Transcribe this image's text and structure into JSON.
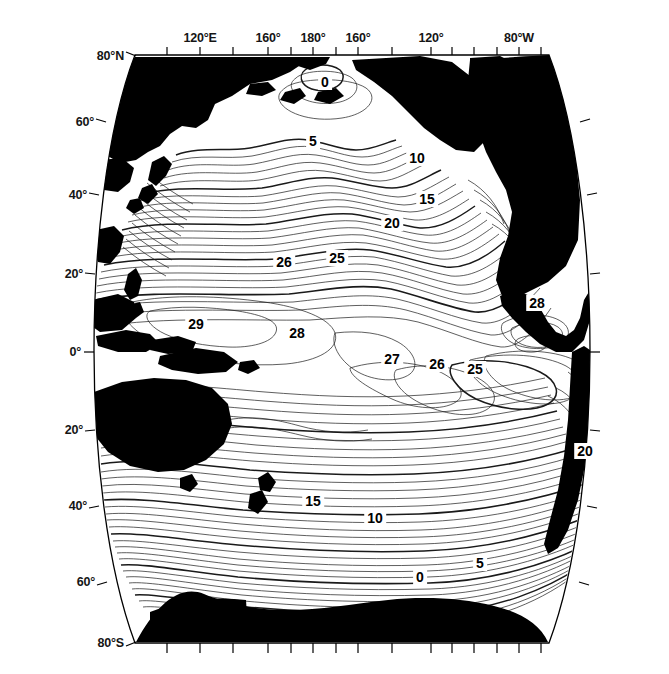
{
  "figure": {
    "kind": "contour-map",
    "title": "",
    "projection": "elliptical-pacific",
    "background_color": "#ffffff",
    "land_color": "#000000",
    "ocean_color": "#ffffff",
    "contour_color": "#1a1a1a"
  },
  "axes": {
    "longitude": {
      "position": "top",
      "labels": [
        {
          "text": "120°E",
          "x": 200
        },
        {
          "text": "160°",
          "x": 268
        },
        {
          "text": "180°",
          "x": 313
        },
        {
          "text": "160°",
          "x": 358
        },
        {
          "text": "120°",
          "x": 431
        },
        {
          "text": "80°W",
          "x": 519
        }
      ],
      "tick_x": [
        167,
        200,
        233,
        268,
        291,
        313,
        336,
        358,
        392,
        431,
        452,
        474,
        497,
        519,
        541
      ]
    },
    "latitude": {
      "position": "left",
      "labels": [
        {
          "text": "80°N",
          "y": 56
        },
        {
          "text": "60°",
          "y": 122
        },
        {
          "text": "40°",
          "y": 195
        },
        {
          "text": "20°",
          "y": 274
        },
        {
          "text": "0°",
          "y": 352
        },
        {
          "text": "20°",
          "y": 430
        },
        {
          "text": "40°",
          "y": 506
        },
        {
          "text": "60°",
          "y": 582
        },
        {
          "text": "80°S",
          "y": 643
        }
      ]
    }
  },
  "chart_data": {
    "type": "contour",
    "title": "",
    "xlabel": "",
    "ylabel": "",
    "variable": "sea surface temperature",
    "units": "°C",
    "contour_interval": 1,
    "bold_contour_interval": 5,
    "xlim": [
      100,
      290
    ],
    "ylim": [
      -80,
      80
    ],
    "levels": [
      0,
      1,
      2,
      3,
      4,
      5,
      6,
      7,
      8,
      9,
      10,
      11,
      12,
      13,
      14,
      15,
      16,
      17,
      18,
      19,
      20,
      21,
      22,
      23,
      24,
      25,
      26,
      27,
      28,
      29
    ],
    "labeled_levels": [
      0,
      5,
      10,
      15,
      20,
      25,
      26,
      27,
      28,
      29
    ],
    "contour_labels": [
      {
        "value": "0",
        "x": 325,
        "y": 82
      },
      {
        "value": "5",
        "x": 313,
        "y": 141
      },
      {
        "value": "10",
        "x": 417,
        "y": 158
      },
      {
        "value": "15",
        "x": 427,
        "y": 199
      },
      {
        "value": "20",
        "x": 392,
        "y": 223
      },
      {
        "value": "25",
        "x": 337,
        "y": 258
      },
      {
        "value": "26",
        "x": 284,
        "y": 262
      },
      {
        "value": "28",
        "x": 537,
        "y": 303
      },
      {
        "value": "29",
        "x": 196,
        "y": 324
      },
      {
        "value": "28",
        "x": 297,
        "y": 333
      },
      {
        "value": "27",
        "x": 392,
        "y": 359
      },
      {
        "value": "26",
        "x": 437,
        "y": 364
      },
      {
        "value": "25",
        "x": 475,
        "y": 369
      },
      {
        "value": "20",
        "x": 585,
        "y": 451
      },
      {
        "value": "15",
        "x": 313,
        "y": 501
      },
      {
        "value": "10",
        "x": 375,
        "y": 518
      },
      {
        "value": "5",
        "x": 480,
        "y": 563
      },
      {
        "value": "0",
        "x": 420,
        "y": 577
      }
    ]
  },
  "regions": {
    "landmasses": [
      "Asia",
      "Japan",
      "Philippines",
      "Indonesia",
      "New Guinea",
      "Australia",
      "New Zealand",
      "Alaska",
      "North America",
      "Central America",
      "South America",
      "Antarctica",
      "Greenland"
    ]
  }
}
